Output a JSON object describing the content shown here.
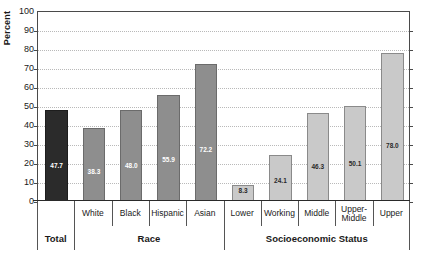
{
  "chart_data": {
    "type": "bar",
    "title": "",
    "xlabel": "",
    "ylabel": "Percent",
    "ylim": [
      0,
      100
    ],
    "yticks": [
      0,
      10,
      20,
      30,
      40,
      50,
      60,
      70,
      80,
      90,
      100
    ],
    "grid": true,
    "legend": "none",
    "categories": [
      "Total",
      "White",
      "Black",
      "Hispanic",
      "Asian",
      "Lower",
      "Working",
      "Middle",
      "Upper-Middle",
      "Upper"
    ],
    "values": [
      47.7,
      38.3,
      48.0,
      55.9,
      72.2,
      8.3,
      24.1,
      46.3,
      50.1,
      78.0
    ],
    "value_labels": [
      "47.7",
      "38.3",
      "48.0",
      "55.9",
      "72.2",
      "8.3",
      "24.1",
      "46.3",
      "50.1",
      "78.0"
    ],
    "bar_colors": [
      "#2b2b2b",
      "#8e8e8e",
      "#8e8e8e",
      "#8e8e8e",
      "#8e8e8e",
      "#c9c9c9",
      "#c9c9c9",
      "#c9c9c9",
      "#c9c9c9",
      "#c9c9c9"
    ],
    "groups": [
      {
        "label": "Total",
        "categories": [
          "Total"
        ]
      },
      {
        "label": "Race",
        "categories": [
          "White",
          "Black",
          "Hispanic",
          "Asian"
        ]
      },
      {
        "label": "Socioeconomic Status",
        "categories": [
          "Lower",
          "Working",
          "Middle",
          "Upper-Middle",
          "Upper"
        ]
      }
    ],
    "category_labels_multiline": {
      "Upper-Middle": [
        "Upper-",
        "Middle"
      ]
    }
  },
  "axis": {
    "y_title": "Percent",
    "y_tick_labels": [
      "100",
      "90",
      "80",
      "70",
      "60",
      "50",
      "40",
      "30",
      "20",
      "10",
      "0"
    ]
  },
  "categories": [
    {
      "name": "Total",
      "label": "",
      "value": 47.7,
      "value_label": "47.7",
      "shade": "dark"
    },
    {
      "name": "White",
      "label": "White",
      "value": 38.3,
      "value_label": "38.3",
      "shade": "mid"
    },
    {
      "name": "Black",
      "label": "Black",
      "value": 48.0,
      "value_label": "48.0",
      "shade": "mid"
    },
    {
      "name": "Hispanic",
      "label": "Hispanic",
      "value": 55.9,
      "value_label": "55.9",
      "shade": "mid"
    },
    {
      "name": "Asian",
      "label": "Asian",
      "value": 72.2,
      "value_label": "72.2",
      "shade": "mid"
    },
    {
      "name": "Lower",
      "label": "Lower",
      "value": 8.3,
      "value_label": "8.3",
      "shade": "light"
    },
    {
      "name": "Working",
      "label": "Working",
      "value": 24.1,
      "value_label": "24.1",
      "shade": "light"
    },
    {
      "name": "Middle",
      "label": "Middle",
      "value": 46.3,
      "value_label": "46.3",
      "shade": "light"
    },
    {
      "name": "UpperMiddle",
      "label": "Upper-\nMiddle",
      "value": 50.1,
      "value_label": "50.1",
      "shade": "light"
    },
    {
      "name": "Upper",
      "label": "Upper",
      "value": 78.0,
      "value_label": "78.0",
      "shade": "light"
    }
  ],
  "groups": [
    {
      "name": "total",
      "label": "Total"
    },
    {
      "name": "race",
      "label": "Race"
    },
    {
      "name": "ses",
      "label": "Socioeconomic Status"
    }
  ]
}
